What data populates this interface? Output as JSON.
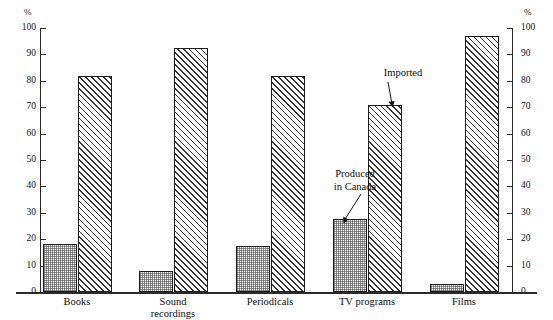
{
  "chart_data": {
    "type": "bar",
    "title": "",
    "subtitle": "",
    "xlabel": "",
    "ylabel": "%",
    "ylabel_right": "%",
    "ylim": [
      0,
      100
    ],
    "ytick_step": 10,
    "yticks": [
      0,
      10,
      20,
      30,
      40,
      50,
      60,
      70,
      80,
      90,
      100
    ],
    "ytick_labels": [
      "0",
      "10",
      "20",
      "30",
      "40",
      "50",
      "60",
      "70",
      "80",
      "90",
      "100"
    ],
    "grid": false,
    "legend_position": "annotated-inline",
    "categories": [
      "Books",
      "Sound\nrecordings",
      "Periodicals",
      "TV programs",
      "Films"
    ],
    "series": [
      {
        "name": "Produced in Canada",
        "fill": "stipple-dotted",
        "values": [
          18,
          8,
          17.5,
          27.5,
          3
        ]
      },
      {
        "name": "Imported",
        "fill": "diagonal-hatch",
        "values": [
          82,
          92.5,
          82,
          71,
          97
        ]
      }
    ],
    "annotations": [
      {
        "text": "Produced\nin Canada",
        "points_to": "TV programs produced-in-canada bar"
      },
      {
        "text": "Imported",
        "points_to": "TV programs imported bar"
      }
    ],
    "colors": {
      "axis": "#2a2a2a",
      "bar_outline": "#1c1c1c",
      "hatch": "#333333",
      "text": "#0d0d0d",
      "background": "#ffffff"
    }
  }
}
